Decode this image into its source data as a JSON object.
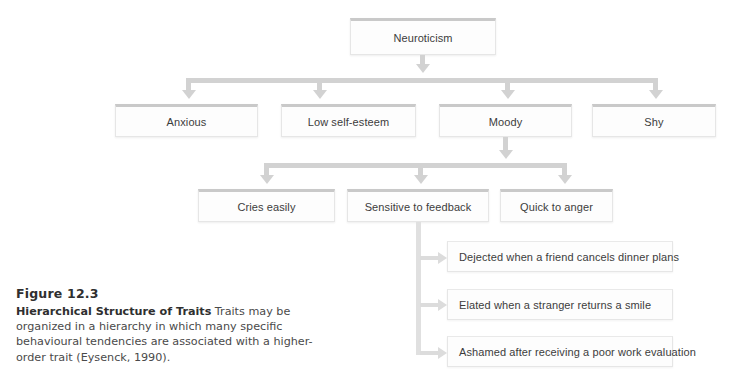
{
  "figure": {
    "number": "Figure 12.3",
    "title": "Hierarchical Structure of Traits",
    "body": " Traits may be organized in a hierarchy in which many specific behavioural tendencies are associated with a higher-order trait (Eysenck, 1990)."
  },
  "diagram": {
    "levels": [
      {
        "name": "super-trait",
        "nodes": [
          {
            "label": "Neuroticism"
          }
        ]
      },
      {
        "name": "traits",
        "nodes": [
          {
            "label": "Anxious"
          },
          {
            "label": "Low self-esteem"
          },
          {
            "label": "Moody"
          },
          {
            "label": "Shy"
          }
        ]
      },
      {
        "name": "habitual-responses",
        "nodes": [
          {
            "label": "Cries easily"
          },
          {
            "label": "Sensitive to feedback"
          },
          {
            "label": "Quick to anger"
          }
        ]
      },
      {
        "name": "specific-responses",
        "nodes": [
          {
            "label": "Dejected when a friend cancels dinner plans"
          },
          {
            "label": "Elated when a stranger returns a smile"
          },
          {
            "label": "Ashamed after receiving a poor work evaluation"
          }
        ]
      }
    ]
  },
  "colors": {
    "connector": "#d2d2d2",
    "box_border": "#e6e6e6",
    "box_top_accent": "#c9c9c9",
    "box_fill": "#fdfdfd",
    "text": "#3c3c3c",
    "caption_heading": "#2f2f2f"
  }
}
